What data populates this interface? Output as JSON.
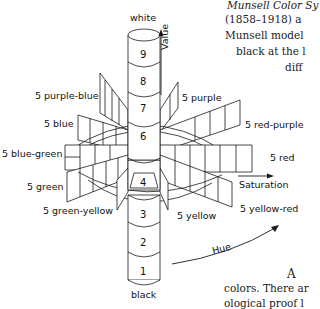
{
  "diagram": {
    "value_axis": {
      "top_label": "white",
      "bottom_label": "black",
      "axis_label": "Value",
      "levels": [
        "9",
        "8",
        "7",
        "6",
        "4",
        "3",
        "2",
        "1"
      ]
    },
    "saturation_label": "Saturation",
    "hue_label": "Hue",
    "hues": [
      "5 purple-blue",
      "5 purple",
      "5 blue",
      "5 red-purple",
      "5 blue-green",
      "5 red",
      "5 green",
      "5 yellow-red",
      "5 green-yellow",
      "5 yellow"
    ]
  },
  "text": {
    "line1": "Munsell Color Sy",
    "line2": "(1858–1918) a",
    "line3": "Munsell model",
    "line4": "black at the l",
    "line5": "diff",
    "line6": "A",
    "line7": "colors. There ar",
    "line8": "ological proof l"
  },
  "colors": {
    "line": "#1a1a1a",
    "background": "#ffffff"
  }
}
